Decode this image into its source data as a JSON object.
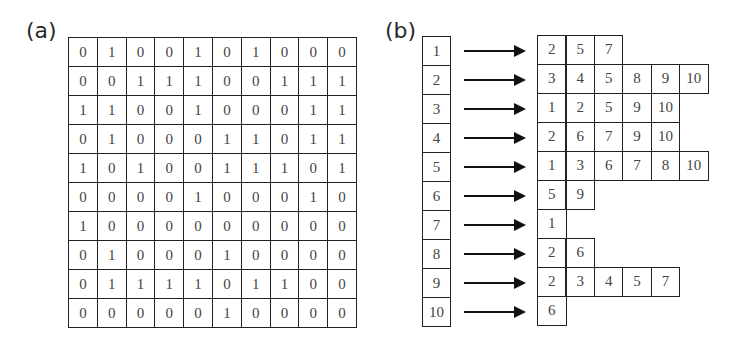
{
  "panel_a": {
    "label": "(a)",
    "description": "adjacency matrix",
    "matrix": [
      [
        "0",
        "1",
        "0",
        "0",
        "1",
        "0",
        "1",
        "0",
        "0",
        "0"
      ],
      [
        "0",
        "0",
        "1",
        "1",
        "1",
        "0",
        "0",
        "1",
        "1",
        "1"
      ],
      [
        "1",
        "1",
        "0",
        "0",
        "1",
        "0",
        "0",
        "0",
        "1",
        "1"
      ],
      [
        "0",
        "1",
        "0",
        "0",
        "0",
        "1",
        "1",
        "0",
        "1",
        "1"
      ],
      [
        "1",
        "0",
        "1",
        "0",
        "0",
        "1",
        "1",
        "1",
        "0",
        "1"
      ],
      [
        "0",
        "0",
        "0",
        "0",
        "1",
        "0",
        "0",
        "0",
        "1",
        "0"
      ],
      [
        "1",
        "0",
        "0",
        "0",
        "0",
        "0",
        "0",
        "0",
        "0",
        "0"
      ],
      [
        "0",
        "1",
        "0",
        "0",
        "0",
        "1",
        "0",
        "0",
        "0",
        "0"
      ],
      [
        "0",
        "1",
        "1",
        "1",
        "1",
        "0",
        "1",
        "1",
        "0",
        "0"
      ],
      [
        "0",
        "0",
        "0",
        "0",
        "0",
        "1",
        "0",
        "0",
        "0",
        "0"
      ]
    ]
  },
  "panel_b": {
    "label": "(b)",
    "description": "adjacency list",
    "rows": [
      {
        "index": "1",
        "neighbors": [
          "2",
          "5",
          "7"
        ]
      },
      {
        "index": "2",
        "neighbors": [
          "3",
          "4",
          "5",
          "8",
          "9",
          "10"
        ]
      },
      {
        "index": "3",
        "neighbors": [
          "1",
          "2",
          "5",
          "9",
          "10"
        ]
      },
      {
        "index": "4",
        "neighbors": [
          "2",
          "6",
          "7",
          "9",
          "10"
        ]
      },
      {
        "index": "5",
        "neighbors": [
          "1",
          "3",
          "6",
          "7",
          "8",
          "10"
        ]
      },
      {
        "index": "6",
        "neighbors": [
          "5",
          "9"
        ]
      },
      {
        "index": "7",
        "neighbors": [
          "1"
        ]
      },
      {
        "index": "8",
        "neighbors": [
          "2",
          "6"
        ]
      },
      {
        "index": "9",
        "neighbors": [
          "2",
          "3",
          "4",
          "5",
          "7"
        ]
      },
      {
        "index": "10",
        "neighbors": [
          "6"
        ]
      }
    ]
  },
  "colors": {
    "line": "#222222",
    "text": "#444444",
    "background": "#ffffff"
  }
}
